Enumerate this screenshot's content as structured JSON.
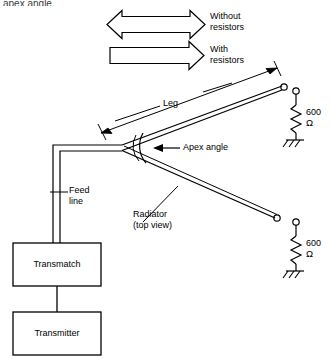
{
  "figure": {
    "title_fragment": "apex angle."
  },
  "legend": {
    "items": [
      {
        "id": "without-resistors",
        "label_line1": "Without",
        "label_line2": "resistors",
        "arrow": "double-headed"
      },
      {
        "id": "with-resistors",
        "label_line1": "With",
        "label_line2": "resistors",
        "arrow": "single-headed"
      }
    ]
  },
  "annotations": {
    "leg": "Leg",
    "apex_angle": "Apex angle",
    "feed_line_line1": "Feed",
    "feed_line_line2": "line",
    "radiator_line1": "Radiator",
    "radiator_line2": "(top view)"
  },
  "terminations": [
    {
      "id": "upper-termination",
      "value": "600",
      "unit": "Ω",
      "symbol": "resistor-to-ground"
    },
    {
      "id": "lower-termination",
      "value": "600",
      "unit": "Ω",
      "symbol": "resistor-to-ground"
    }
  ],
  "blocks": [
    {
      "id": "transmatch",
      "label": "Transmatch"
    },
    {
      "id": "transmitter",
      "label": "Transmitter"
    }
  ],
  "colors": {
    "ink": "#000000",
    "paper": "#ffffff",
    "faded_ink": "#3a3a3a"
  }
}
